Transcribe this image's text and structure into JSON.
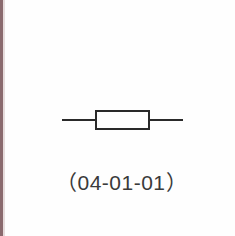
{
  "diagram": {
    "symbol": "resistor",
    "label": "（04-01-01）",
    "colors": {
      "stroke": "#2a2a2a",
      "background": "#fefefe",
      "border": "#8a6a6e"
    }
  }
}
